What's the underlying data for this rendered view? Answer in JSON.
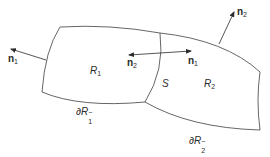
{
  "diagram": {
    "type": "two-region boundary diagram",
    "colors": {
      "stroke": "#555555",
      "arrow": "#2a2a2a",
      "text": "#2a2a2a",
      "background": "#ffffff"
    },
    "regions": [
      {
        "id": "R1",
        "label": "R",
        "subscript": "1"
      },
      {
        "id": "R2",
        "label": "R",
        "subscript": "2"
      }
    ],
    "interface": {
      "label": "S"
    },
    "boundaries": [
      {
        "label_prefix": "∂R",
        "subscript": "1",
        "superscript": "−"
      },
      {
        "label_prefix": "∂R",
        "subscript": "2",
        "superscript": "−"
      }
    ],
    "normals": [
      {
        "label": "n",
        "subscript": "1",
        "position": "left outer boundary of R1"
      },
      {
        "label": "n",
        "subscript": "2",
        "position": "top outer boundary of R2"
      },
      {
        "label": "n",
        "subscript": "2",
        "position": "interface S, pointing into R1"
      },
      {
        "label": "n",
        "subscript": "1",
        "position": "interface S, pointing into R2"
      }
    ]
  }
}
